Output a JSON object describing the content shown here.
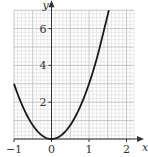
{
  "chart_data": {
    "type": "line",
    "title": "",
    "xlabel": "x",
    "ylabel": "y",
    "xlim": [
      -1,
      2.2
    ],
    "ylim": [
      0,
      7
    ],
    "grid": true,
    "x_ticks": [
      -1,
      0,
      1,
      2
    ],
    "x_tick_labels": [
      "−1",
      "0",
      "1",
      "2"
    ],
    "y_ticks": [
      2,
      4,
      6
    ],
    "y_tick_labels": [
      "2",
      "4",
      "6"
    ],
    "series": [
      {
        "name": "y = 3x²",
        "x": [
          -1,
          -0.75,
          -0.5,
          -0.25,
          0,
          0.25,
          0.5,
          0.75,
          1,
          1.25,
          1.5,
          1.53
        ],
        "y": [
          3,
          1.69,
          0.75,
          0.19,
          0,
          0.19,
          0.75,
          1.69,
          3,
          4.69,
          6.75,
          7.0
        ]
      }
    ],
    "colors": {
      "curve": "#1a1a1a",
      "grid_minor": "#d4d4d4",
      "grid_major": "#b8b8b8",
      "axis": "#333333"
    }
  }
}
